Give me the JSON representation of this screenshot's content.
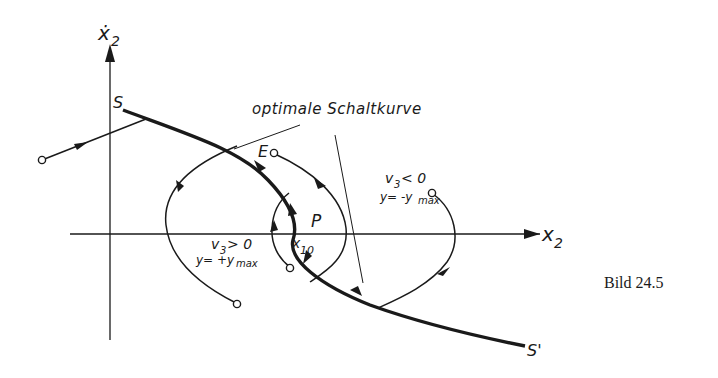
{
  "figure": {
    "caption": "Bild 24.5",
    "title_annotation": "optimale Schaltkurve",
    "axes": {
      "x_label": "x",
      "x_sub": "2",
      "y_label": "ẋ",
      "y_sub": "2"
    },
    "points": {
      "S": "S",
      "S_prime": "S'",
      "E": "E",
      "P": "P",
      "x10_main": "x",
      "x10_sub": "10"
    },
    "regions": {
      "upper_right": {
        "cond_main": "v",
        "cond_sub": "3",
        "cond_rel": "< 0",
        "y_main": "y= -y",
        "y_sub": "max"
      },
      "lower_left": {
        "cond_main": "v",
        "cond_sub": "3",
        "cond_rel": "> 0",
        "y_main": "y= +y",
        "y_sub": "max"
      }
    },
    "colors": {
      "ink": "#1a1a1a",
      "background": "#ffffff"
    }
  }
}
